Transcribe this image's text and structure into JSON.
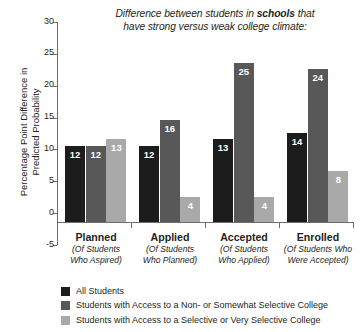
{
  "chart_data": {
    "type": "bar",
    "title": "Difference between students in schools that have strong versus weak college climate:",
    "title_line1_pre": "Difference between students in ",
    "title_line1_bold": "schools",
    "title_line1_post": " that",
    "title_line2": "have strong versus weak college climate:",
    "title_bold_word": "schools",
    "xlabel": "",
    "ylabel": "Percentage Point Difference in Predicted Probability",
    "ylabel_line1": "Percentage Point Difference in",
    "ylabel_line2": "Predicted Probability",
    "ylim": [
      -5,
      30
    ],
    "yticks": [
      30,
      25,
      20,
      15,
      10,
      5,
      0,
      -5
    ],
    "ytick_labels": [
      "30",
      "25",
      "20",
      "15",
      "10",
      "5",
      "0",
      "-5"
    ],
    "grid": false,
    "legend_position": "bottom-left",
    "categories": [
      "Planned",
      "Applied",
      "Accepted",
      "Enrolled"
    ],
    "category_subtitles": [
      [
        "(Of Students",
        "Who Aspired)"
      ],
      [
        "(Of Students",
        "Who Planned)"
      ],
      [
        "(Of Students",
        "Who Applied)"
      ],
      [
        "(Of Students Who",
        "Were Accepted)"
      ]
    ],
    "series": [
      {
        "name": "All Students",
        "color": "#1c1c1c",
        "values": [
          12,
          12,
          13,
          14
        ],
        "labels": [
          "12",
          "12",
          "13",
          "14"
        ]
      },
      {
        "name": "Students with Access to a Non- or Somewhat Selective College",
        "color": "#585858",
        "values": [
          12,
          16,
          25,
          24
        ],
        "labels": [
          "12",
          "16",
          "25",
          "24"
        ]
      },
      {
        "name": "Students with Access to a Selective or Very Selective College",
        "color": "#a9a9a9",
        "values": [
          13,
          4,
          4,
          8
        ],
        "labels": [
          "13",
          "4",
          "4",
          "8"
        ]
      }
    ]
  },
  "legend": {
    "items": [
      {
        "label": "All Students",
        "color": "#1c1c1c"
      },
      {
        "label": "Students with Access to a Non- or Somewhat Selective College",
        "color": "#585858"
      },
      {
        "label": "Students with Access to a Selective or Very Selective College",
        "color": "#a9a9a9"
      }
    ]
  },
  "axis": {
    "line_color": "#6d6e71"
  }
}
